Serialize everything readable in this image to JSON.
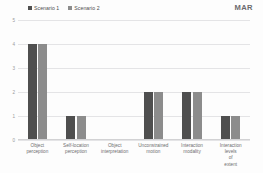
{
  "corner_tag": "MAR",
  "legend": {
    "position": "top-left",
    "entries": [
      {
        "label": "Scenario 1",
        "color": "#4f4f4f",
        "marker": "square-marker-icon"
      },
      {
        "label": "Scenario 2",
        "color": "#8c8c8c",
        "marker": "square-marker-icon"
      }
    ]
  },
  "chart_data": {
    "type": "bar",
    "title": "",
    "subtitle": "",
    "xlabel": "",
    "ylabel": "",
    "ylim": [
      0,
      5
    ],
    "yticks": [
      "0",
      "1",
      "2",
      "3",
      "4",
      "5"
    ],
    "grid": true,
    "legend_position": "top-left",
    "categories": [
      "Object perception",
      "Self-location perception",
      "Object interpretation",
      "Unconstrained motion",
      "Interaction modality",
      "Interaction levels of extent"
    ],
    "series": [
      {
        "name": "Scenario 1",
        "color": "#4f4f4f",
        "values": [
          4,
          1,
          0,
          2,
          2,
          1
        ]
      },
      {
        "name": "Scenario 2",
        "color": "#8c8c8c",
        "values": [
          4,
          1,
          0,
          2,
          2,
          1
        ]
      }
    ]
  }
}
